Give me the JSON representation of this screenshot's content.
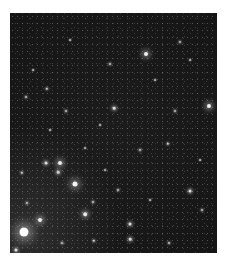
{
  "image": {
    "subject": "star field",
    "background_color": "#171717",
    "frame": {
      "left": 10,
      "top": 13,
      "width": 207,
      "height": 240
    }
  },
  "stars": [
    {
      "x": 24,
      "y": 232,
      "r": 4.5,
      "glow": 10,
      "color": "#ffffff"
    },
    {
      "x": 75,
      "y": 184,
      "r": 2.5,
      "glow": 6,
      "color": "#f4f4f4"
    },
    {
      "x": 60,
      "y": 163,
      "r": 2.0,
      "glow": 5,
      "color": "#eeeeee"
    },
    {
      "x": 46,
      "y": 163,
      "r": 1.5,
      "glow": 3,
      "color": "#dddddd"
    },
    {
      "x": 58,
      "y": 172,
      "r": 1.3,
      "glow": 3,
      "color": "#cccccc"
    },
    {
      "x": 40,
      "y": 220,
      "r": 2.0,
      "glow": 5,
      "color": "#eeeeee"
    },
    {
      "x": 146,
      "y": 54,
      "r": 2.0,
      "glow": 5,
      "color": "#f2f2f2"
    },
    {
      "x": 209,
      "y": 106,
      "r": 2.0,
      "glow": 5,
      "color": "#f2f2f2"
    },
    {
      "x": 114,
      "y": 108,
      "r": 1.3,
      "glow": 3,
      "color": "#d8d8d8"
    },
    {
      "x": 47,
      "y": 89,
      "r": 1.2,
      "glow": 2,
      "color": "#cccccc"
    },
    {
      "x": 85,
      "y": 214,
      "r": 1.8,
      "glow": 4,
      "color": "#e8e8e8"
    },
    {
      "x": 130,
      "y": 224,
      "r": 1.5,
      "glow": 3,
      "color": "#dddddd"
    },
    {
      "x": 130,
      "y": 239,
      "r": 1.3,
      "glow": 3,
      "color": "#d4d4d4"
    },
    {
      "x": 190,
      "y": 191,
      "r": 1.5,
      "glow": 3,
      "color": "#dddddd"
    },
    {
      "x": 168,
      "y": 144,
      "r": 1.2,
      "glow": 2,
      "color": "#cccccc"
    },
    {
      "x": 22,
      "y": 173,
      "r": 1.2,
      "glow": 2,
      "color": "#cccccc"
    },
    {
      "x": 16,
      "y": 250,
      "r": 1.5,
      "glow": 3,
      "color": "#dddddd"
    },
    {
      "x": 94,
      "y": 241,
      "r": 1.2,
      "glow": 2,
      "color": "#cccccc"
    },
    {
      "x": 27,
      "y": 203,
      "r": 1.1,
      "glow": 2,
      "color": "#bbbbbb"
    },
    {
      "x": 180,
      "y": 42,
      "r": 1.1,
      "glow": 2,
      "color": "#bbbbbb"
    },
    {
      "x": 110,
      "y": 64,
      "r": 1.0,
      "glow": 2,
      "color": "#bbbbbb"
    },
    {
      "x": 26,
      "y": 97,
      "r": 1.0,
      "glow": 2,
      "color": "#bbbbbb"
    },
    {
      "x": 66,
      "y": 111,
      "r": 1.0,
      "glow": 2,
      "color": "#bbbbbb"
    },
    {
      "x": 175,
      "y": 111,
      "r": 1.0,
      "glow": 2,
      "color": "#bbbbbb"
    },
    {
      "x": 93,
      "y": 202,
      "r": 1.0,
      "glow": 2,
      "color": "#bbbbbb"
    },
    {
      "x": 62,
      "y": 243,
      "r": 1.0,
      "glow": 2,
      "color": "#bbbbbb"
    },
    {
      "x": 169,
      "y": 243,
      "r": 1.0,
      "glow": 2,
      "color": "#bbbbbb"
    },
    {
      "x": 202,
      "y": 210,
      "r": 1.0,
      "glow": 2,
      "color": "#bbbbbb"
    },
    {
      "x": 118,
      "y": 190,
      "r": 1.0,
      "glow": 2,
      "color": "#bbbbbb"
    },
    {
      "x": 140,
      "y": 150,
      "r": 1.0,
      "glow": 2,
      "color": "#bbbbbb"
    },
    {
      "x": 85,
      "y": 148,
      "r": 0.9,
      "glow": 1,
      "color": "#aaaaaa"
    },
    {
      "x": 33,
      "y": 70,
      "r": 0.9,
      "glow": 1,
      "color": "#aaaaaa"
    },
    {
      "x": 70,
      "y": 40,
      "r": 0.9,
      "glow": 1,
      "color": "#aaaaaa"
    },
    {
      "x": 155,
      "y": 80,
      "r": 0.9,
      "glow": 1,
      "color": "#aaaaaa"
    },
    {
      "x": 190,
      "y": 60,
      "r": 0.9,
      "glow": 1,
      "color": "#aaaaaa"
    },
    {
      "x": 100,
      "y": 125,
      "r": 0.9,
      "glow": 1,
      "color": "#aaaaaa"
    },
    {
      "x": 50,
      "y": 130,
      "r": 0.9,
      "glow": 1,
      "color": "#aaaaaa"
    },
    {
      "x": 200,
      "y": 160,
      "r": 0.9,
      "glow": 1,
      "color": "#aaaaaa"
    },
    {
      "x": 150,
      "y": 200,
      "r": 0.9,
      "glow": 1,
      "color": "#aaaaaa"
    },
    {
      "x": 105,
      "y": 170,
      "r": 0.9,
      "glow": 1,
      "color": "#aaaaaa"
    }
  ]
}
